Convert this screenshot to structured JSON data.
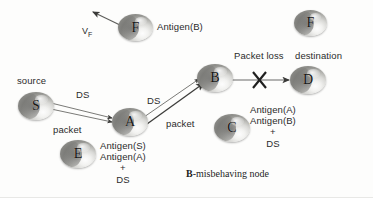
{
  "diagram": {
    "title_caption": "B-misbehaving node",
    "caption_bold_prefix": "B",
    "caption_rest": "-misbehaving node",
    "nodes": [
      {
        "id": "F_top",
        "label": "F",
        "name": "node-f-top"
      },
      {
        "id": "F_right",
        "label": "F",
        "name": "node-f-right"
      },
      {
        "id": "S",
        "label": "S",
        "name": "node-s"
      },
      {
        "id": "A",
        "label": "A",
        "name": "node-a"
      },
      {
        "id": "B",
        "label": "B",
        "name": "node-b"
      },
      {
        "id": "D",
        "label": "D",
        "name": "node-d"
      },
      {
        "id": "C",
        "label": "C",
        "name": "node-c"
      },
      {
        "id": "E",
        "label": "E",
        "name": "node-e"
      }
    ],
    "labels": {
      "vf": "V",
      "vf_sub": "F",
      "antigen_b": "Antigen(B)",
      "source": "source",
      "destination": "destination",
      "packet_loss": "Packet loss",
      "ds_s_to_a": "DS",
      "packet_s_to_a": "packet",
      "ds_a_to_b": "DS",
      "packet_a_to_b": "packet",
      "e_line1": "Antigen(S)",
      "e_line2": "Antigen(A)",
      "e_line3": "+",
      "e_line4": "DS",
      "c_line1": "Antigen(A)",
      "c_line2": "Antigen(B)",
      "c_line3": "+",
      "c_line4": "DS"
    },
    "colors": {
      "background": "#fdfdfc",
      "text": "#2b2b2b",
      "edge": "#6b6b68",
      "node_dark": "#6d6d69",
      "node_light": "#f2f2f0"
    }
  }
}
